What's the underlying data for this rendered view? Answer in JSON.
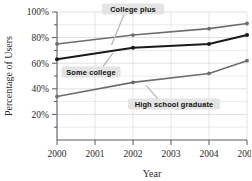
{
  "chart_data": {
    "type": "line",
    "title": "",
    "xlabel": "Year",
    "ylabel": "Percentage of Users",
    "x": [
      2000,
      2001,
      2002,
      2003,
      2004,
      2005
    ],
    "xticklabels": [
      "2000",
      "2001",
      "2002",
      "2003",
      "2004",
      "2005"
    ],
    "xlim": [
      2000,
      2005
    ],
    "ylim": [
      0,
      100
    ],
    "yticklabels": [
      "20%",
      "40%",
      "60%",
      "80%",
      "100%"
    ],
    "ytickvalues": [
      20,
      40,
      60,
      80,
      100
    ],
    "yminorstep": 10,
    "grid": true,
    "legend_position": "inline-callouts",
    "series": [
      {
        "name": "College plus",
        "color": "#6e6e6e",
        "x": [
          2000,
          2002,
          2004,
          2005
        ],
        "values": [
          75,
          82,
          87,
          91
        ]
      },
      {
        "name": "Some college",
        "color": "#1a1a1a",
        "x": [
          2000,
          2002,
          2004,
          2005
        ],
        "values": [
          63,
          72,
          75,
          82
        ]
      },
      {
        "name": "High school graduate",
        "color": "#6e6e6e",
        "x": [
          2000,
          2002,
          2004,
          2005
        ],
        "values": [
          34,
          45,
          52,
          62
        ]
      }
    ],
    "annotations": [
      {
        "label": "College plus",
        "series": "College plus"
      },
      {
        "label": "Some college",
        "series": "Some college"
      },
      {
        "label": "High school graduate",
        "series": "High school graduate"
      }
    ]
  },
  "axes": {
    "y_title": "Percentage of Users",
    "x_title": "Year",
    "y_ticks": [
      "100%",
      "80%",
      "60%",
      "40%",
      "20%"
    ],
    "x_ticks": [
      "2000",
      "2001",
      "2002",
      "2003",
      "2004",
      "2005"
    ]
  },
  "callouts": {
    "college_plus": "College plus",
    "some_college": "Some college",
    "high_school": "High school graduate"
  },
  "colors": {
    "line_gray": "#6e6e6e",
    "line_dark": "#1a1a1a",
    "grid": "#d9d9d9",
    "axis": "#5a5a5a",
    "callout_bg": "#e4e4e4",
    "text": "#2b2b2b"
  }
}
